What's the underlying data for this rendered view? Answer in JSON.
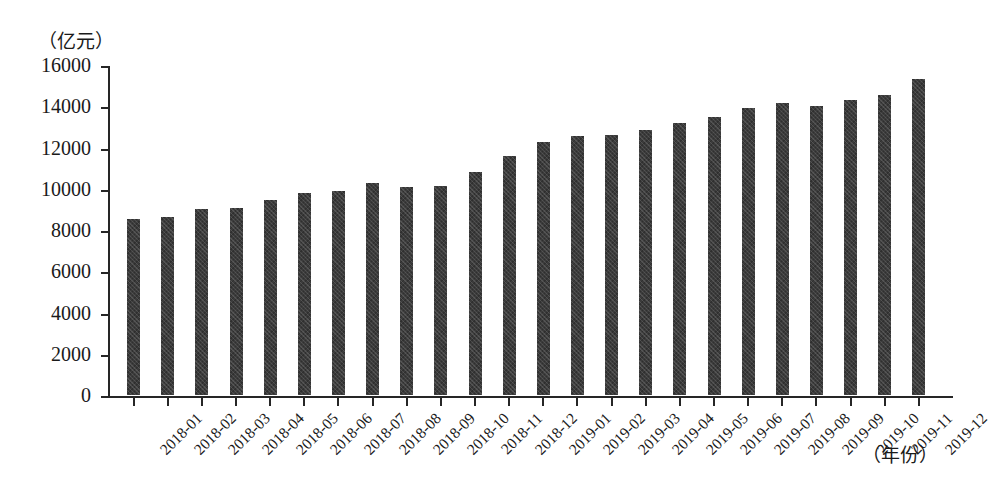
{
  "chart_data": {
    "type": "bar",
    "title": "",
    "subtitle": "",
    "xlabel": "（年份）",
    "ylabel": "（亿元）",
    "ylim": [
      0,
      16000
    ],
    "ytick_step": 2000,
    "ytick_labels": [
      "16000",
      "14000",
      "12000",
      "10000",
      "8000",
      "6000",
      "4000",
      "2000",
      "0"
    ],
    "grid": false,
    "legend": null,
    "bar_color": "#3b3b3b",
    "axis_color": "#262626",
    "categories": [
      "2018-01",
      "2018-02",
      "2018-03",
      "2018-04",
      "2018-05",
      "2018-06",
      "2018-07",
      "2018-08",
      "2018-09",
      "2018-10",
      "2018-11",
      "2018-12",
      "2019-01",
      "2019-02",
      "2019-03",
      "2019-04",
      "2019-05",
      "2019-06",
      "2019-07",
      "2019-08",
      "2019-09",
      "2019-10",
      "2019-11",
      "2019-12"
    ],
    "values": [
      8550,
      8650,
      9000,
      9050,
      9450,
      9800,
      9900,
      10300,
      10100,
      10150,
      10800,
      11600,
      12250,
      12550,
      12600,
      12850,
      13200,
      13500,
      13900,
      14150,
      14000,
      14300,
      14550,
      15300
    ]
  }
}
